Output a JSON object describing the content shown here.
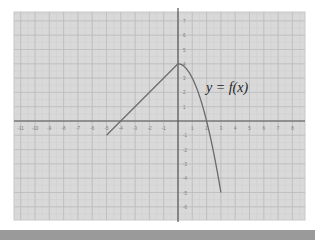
{
  "chart_data": {
    "type": "line",
    "title": "",
    "function_label": "y = f(x)",
    "xlabel": "",
    "ylabel": "",
    "xlim": [
      -11,
      8
    ],
    "ylim": [
      -6,
      7
    ],
    "x_ticks": [
      -11,
      -10,
      -9,
      -8,
      -7,
      -6,
      -5,
      -4,
      -3,
      -2,
      -1,
      1,
      2,
      3,
      4,
      5,
      6,
      7,
      8
    ],
    "y_ticks": [
      7,
      6,
      5,
      4,
      3,
      2,
      1,
      -1,
      -2,
      -3,
      -4,
      -5,
      -6
    ],
    "grid": true,
    "legend": null,
    "series": [
      {
        "name": "f(x) linear piece",
        "description": "line segment from (-5,-1) to (0,4)",
        "x": [
          -5,
          0
        ],
        "y": [
          -1,
          4
        ]
      },
      {
        "name": "f(x) quadratic piece",
        "description": "y = 4 - x^2 for 0 <= x <= 3",
        "x": [
          0,
          0.5,
          1,
          1.5,
          2,
          2.5,
          3
        ],
        "y": [
          4,
          3.75,
          3,
          1.75,
          0,
          -2.25,
          -5
        ]
      }
    ],
    "key_points": [
      {
        "x": -5,
        "y": -1,
        "note": "left endpoint"
      },
      {
        "x": -4,
        "y": 0,
        "note": "x-intercept"
      },
      {
        "x": 0,
        "y": 4,
        "note": "peak"
      },
      {
        "x": 2,
        "y": 0,
        "note": "x-intercept"
      },
      {
        "x": 3,
        "y": -5,
        "note": "right endpoint"
      }
    ]
  },
  "colors": {
    "plot_background": "#d9d9d9",
    "grid_minor": "#cfcfcf",
    "grid_major": "#bdbdbd",
    "axis": "#555555",
    "curve": "#6a6a6a",
    "tick_label": "#7a7a7a",
    "bottom_bar": "#9a9a9a"
  }
}
